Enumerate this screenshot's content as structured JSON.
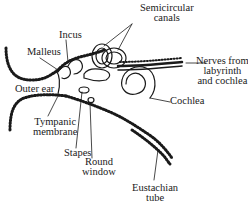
{
  "diagram": {
    "colors": {
      "ink": "#1a1a1a",
      "background": "#ffffff"
    },
    "labels": {
      "semicircular_canals_1": "Semicircular",
      "semicircular_canals_2": "canals",
      "incus": "Incus",
      "malleus": "Malleus",
      "outer_ear": "Outer ear",
      "nerves_1": "Nerves from",
      "nerves_2": "labyrinth",
      "nerves_3": "and cochlea",
      "cochlea": "Cochlea",
      "tympanic_1": "Tympanic",
      "tympanic_2": "membrane",
      "stapes": "Stapes",
      "round_window_1": "Round",
      "round_window_2": "window",
      "eustachian_1": "Eustachian",
      "eustachian_2": "tube"
    }
  }
}
